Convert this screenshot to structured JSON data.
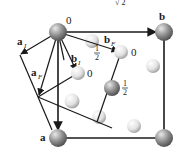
{
  "header_fragment": "√ 2",
  "vectors": {
    "a": {
      "label": "a"
    },
    "b": {
      "label": "b"
    },
    "a_I": {
      "main": "a",
      "sub": "I"
    },
    "a_F": {
      "main": "a",
      "sub": "F"
    },
    "b_I": {
      "main": "b",
      "sub": "I"
    },
    "b_F": {
      "main": "b",
      "sub": "F"
    }
  },
  "height_labels": {
    "origin": "0",
    "bF_tip": "0",
    "bI_tip": "0",
    "half_top_num": "1",
    "half_top_den": "2",
    "half_mid_num": "1",
    "half_mid_den": "2"
  },
  "colors": {
    "sphere_dark": "#6e6e6e",
    "sphere_light": "#f4f4f4",
    "line": "#1a1a1a"
  }
}
